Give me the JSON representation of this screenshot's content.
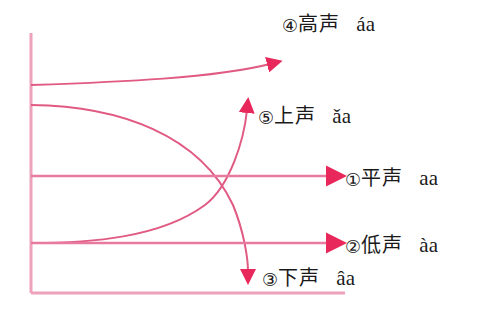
{
  "figure": {
    "type": "tone-contour-diagram",
    "palette": {
      "line": "#e8799f",
      "line_dark": "#e05a83",
      "arrow": "#e8285a",
      "axis": "#eda2ba",
      "text": "#1a1a1a",
      "background": "#ffffff"
    },
    "axes": {
      "vertical": {
        "x": 31,
        "y_top": 33,
        "y_bottom": 293
      },
      "horizontal": {
        "y": 293,
        "x_left": 31,
        "x_right": 345
      }
    }
  },
  "tones": [
    {
      "id": "tone-4",
      "marker": "④",
      "cjk": "高声",
      "roman": "áa",
      "contour": "rising",
      "start_y": 85,
      "end_y": 57,
      "arrow": "up-right"
    },
    {
      "id": "tone-5",
      "marker": "⑤",
      "cjk": "上声",
      "roman": "ǎa",
      "contour": "falling-rising",
      "start_y": 105,
      "end_y": 95,
      "arrow": "up"
    },
    {
      "id": "tone-1",
      "marker": "①",
      "cjk": "平声",
      "roman": "aa",
      "contour": "level",
      "start_y": 176,
      "end_y": 176,
      "arrow": "right"
    },
    {
      "id": "tone-2",
      "marker": "②",
      "cjk": "低声",
      "roman": "àa",
      "contour": "level-low",
      "start_y": 243,
      "end_y": 243,
      "arrow": "right"
    },
    {
      "id": "tone-3",
      "marker": "③",
      "cjk": "下声",
      "roman": "âa",
      "contour": "falling",
      "start_y": 105,
      "end_y": 285,
      "arrow": "down"
    }
  ]
}
